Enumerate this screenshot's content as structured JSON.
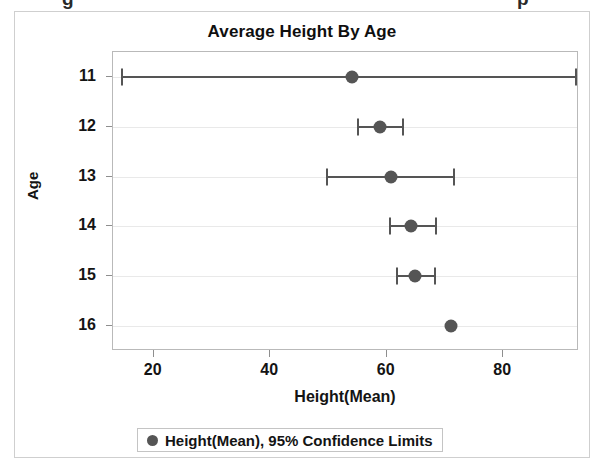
{
  "figure": {
    "clipped_top_text": "g p",
    "border_color": "#cfcfcf"
  },
  "legend": {
    "label": "Height(Mean), 95% Confidence Limits",
    "marker": "filled-circle",
    "position": "bottom-center"
  },
  "colors": {
    "marker": "#555555",
    "grid": "#e9e9e9",
    "axis": "#b9b9b9",
    "text": "#141414"
  },
  "chart_data": {
    "type": "scatter",
    "title": "Average Height By Age",
    "xlabel": "Height(Mean)",
    "ylabel": "Age",
    "xlim": [
      13,
      93
    ],
    "xticks": [
      20,
      40,
      60,
      80
    ],
    "xtick_labels": [
      "20",
      "40",
      "60",
      "80"
    ],
    "categories": [
      11,
      12,
      13,
      14,
      15,
      16
    ],
    "ytick_labels": [
      "11",
      "12",
      "13",
      "14",
      "15",
      "16"
    ],
    "grid": "y-only",
    "error_bars": "95% confidence limits",
    "series": [
      {
        "name": "Height(Mean), 95% Confidence Limits",
        "points": [
          {
            "age": 11,
            "mean": 54.1,
            "lower": 14.5,
            "upper": 92.4
          },
          {
            "age": 12,
            "mean": 58.8,
            "lower": 55.0,
            "upper": 62.7
          },
          {
            "age": 13,
            "mean": 60.8,
            "lower": 49.7,
            "upper": 71.6
          },
          {
            "age": 14,
            "mean": 64.1,
            "lower": 60.6,
            "upper": 68.5
          },
          {
            "age": 15,
            "mean": 64.8,
            "lower": 61.7,
            "upper": 68.2
          },
          {
            "age": 16,
            "mean": 71.0,
            "lower": null,
            "upper": null
          }
        ]
      }
    ]
  }
}
